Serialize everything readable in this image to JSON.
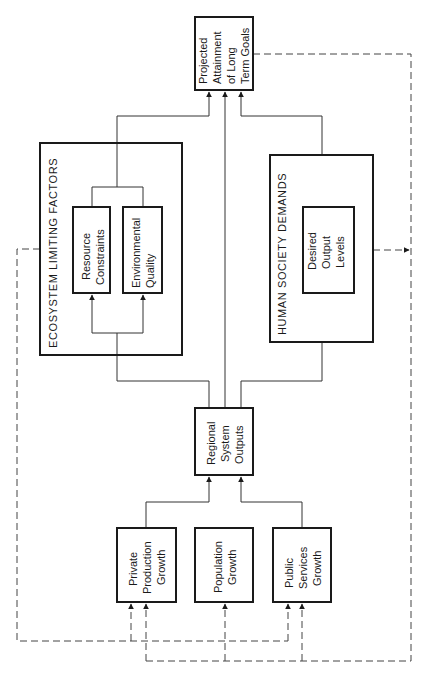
{
  "diagram": {
    "orientation": "rotated-90-ccw",
    "nodes": {
      "projected": {
        "lines": [
          "Projected",
          "Attainment",
          "of Long",
          "Term Goals"
        ]
      },
      "ecosystem": {
        "title": "ECOSYSTEM LIMITING FACTORS",
        "resource": {
          "lines": [
            "Resource",
            "Constraints"
          ]
        },
        "environmental": {
          "lines": [
            "Environmental",
            "Quality"
          ]
        }
      },
      "human_society": {
        "title": "HUMAN SOCIETY DEMANDS",
        "desired": {
          "lines": [
            "Desired",
            "Output",
            "Levels"
          ]
        }
      },
      "regional": {
        "lines": [
          "Regional",
          "System",
          "Outputs"
        ]
      },
      "private": {
        "lines": [
          "Private",
          "Production",
          "Growth"
        ]
      },
      "population": {
        "lines": [
          "Population",
          "Growth"
        ]
      },
      "public": {
        "lines": [
          "Public",
          "Services",
          "Growth"
        ]
      }
    },
    "edges": [
      {
        "from": "Private Production Growth",
        "to": "Regional System Outputs",
        "style": "solid"
      },
      {
        "from": "Public Services Growth",
        "to": "Regional System Outputs",
        "style": "solid"
      },
      {
        "from": "Regional System Outputs",
        "to": "Ecosystem Limiting Factors",
        "style": "solid"
      },
      {
        "from": "Regional System Outputs",
        "to": "Projected Attainment of Long Term Goals",
        "style": "solid"
      },
      {
        "from": "Regional System Outputs",
        "to": "Human Society Demands",
        "style": "solid"
      },
      {
        "from": "Ecosystem Limiting Factors",
        "to": "Projected Attainment of Long Term Goals",
        "style": "solid"
      },
      {
        "from": "Human Society Demands",
        "to": "Projected Attainment of Long Term Goals",
        "style": "solid"
      },
      {
        "from": "Ecosystem Limiting Factors",
        "to": "Private Production Growth",
        "style": "dashed"
      },
      {
        "from": "Ecosystem Limiting Factors",
        "to": "Public Services Growth",
        "style": "dashed"
      },
      {
        "from": "Projected Attainment of Long Term Goals",
        "to": "Private Production Growth",
        "style": "dashed"
      },
      {
        "from": "Projected Attainment of Long Term Goals",
        "to": "Population Growth",
        "style": "dashed"
      },
      {
        "from": "Projected Attainment of Long Term Goals",
        "to": "Public Services Growth",
        "style": "dashed"
      },
      {
        "from": "Human Society Demands",
        "to": "feedback loop",
        "style": "dashed"
      }
    ],
    "colors": {
      "ink": "#1a1a1a",
      "background": "#ffffff"
    }
  }
}
